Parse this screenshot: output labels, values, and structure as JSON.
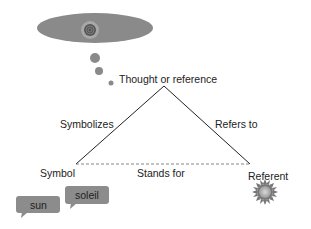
{
  "diagram": {
    "type": "semiotic-triangle",
    "nodes": {
      "thought": "Thought or reference",
      "symbol": "Symbol",
      "referent": "Referent"
    },
    "edges": {
      "symbolizes": "Symbolizes",
      "refers_to": "Refers to",
      "stands_for": "Stands for"
    },
    "bubbles": {
      "sun": "sun",
      "soleil": "soleil"
    },
    "colors": {
      "ellipse": "#8a8a8a",
      "bubble": "#8c8c8c",
      "line": "#222222"
    }
  }
}
